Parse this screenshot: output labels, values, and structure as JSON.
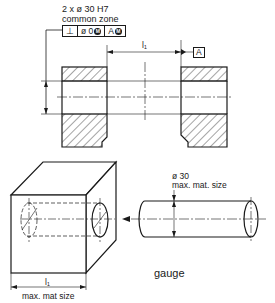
{
  "diagram": {
    "top_view": {
      "callout": {
        "line1": "2 x ø 30 H7",
        "line2": "common zone"
      },
      "feature_control_frame": {
        "symbol": "⊥",
        "tolerance": "ø 0",
        "tolerance_modifier": "M",
        "datum": "A",
        "datum_modifier": "M"
      },
      "dimension_l1": "l₁",
      "datum_label": "A"
    },
    "bottom_view": {
      "cube_dimension_label": "l₁",
      "cube_dimension_note": "max. mat size",
      "gauge_diameter": "ø 30",
      "gauge_diameter_note": "max. mat. size",
      "gauge_label": "gauge"
    },
    "colors": {
      "line": "#1a1a1a",
      "background": "#ffffff"
    }
  }
}
